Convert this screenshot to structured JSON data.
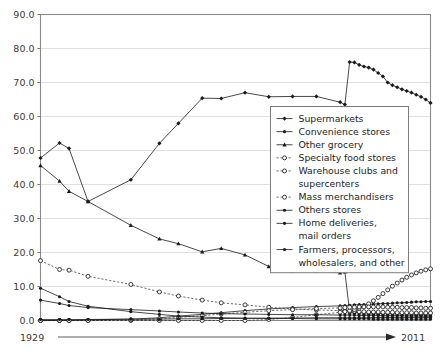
{
  "chart_data": {
    "type": "line",
    "title": "",
    "xlabel": "",
    "ylabel": "",
    "ylim": [
      0,
      90
    ],
    "yticks": [
      "0.0",
      "10.0",
      "20.0",
      "30.0",
      "40.0",
      "50.0",
      "60.0",
      "70.0",
      "80.0",
      "90.0"
    ],
    "ytick_values": [
      0,
      10,
      20,
      30,
      40,
      50,
      60,
      70,
      80,
      90
    ],
    "grid": true,
    "legend_position": "center-right",
    "x_axis": {
      "start_label": "1929",
      "end_label": "2011",
      "arrow": true,
      "x_start": 1929,
      "x_end": 2011
    },
    "x": [
      1929,
      1933,
      1935,
      1939,
      1948,
      1954,
      1958,
      1963,
      1967,
      1972,
      1977,
      1982,
      1987,
      1992,
      1993,
      1994,
      1995,
      1996,
      1997,
      1998,
      1999,
      2000,
      2001,
      2002,
      2003,
      2004,
      2005,
      2006,
      2007,
      2008,
      2009,
      2010,
      2011
    ],
    "series": [
      {
        "name": "Supermarkets",
        "marker": "filled-diamond",
        "linestyle": "solid",
        "values": [
          47.8,
          52.2,
          50.6,
          35.0,
          41.4,
          52.1,
          58.0,
          65.4,
          65.3,
          67.0,
          65.8,
          65.9,
          65.9,
          64.2,
          63.5,
          76.0,
          75.9,
          75.2,
          74.7,
          74.4,
          73.8,
          72.8,
          71.8,
          70.0,
          69.2,
          68.6,
          68.0,
          67.5,
          67.0,
          66.4,
          65.8,
          65.0,
          64.0
        ]
      },
      {
        "name": "Convenience stores",
        "marker": "filled-dot",
        "linestyle": "solid",
        "values": [
          0.0,
          0.0,
          0.0,
          0.2,
          0.4,
          0.8,
          1.3,
          1.8,
          2.3,
          2.9,
          3.4,
          3.8,
          4.1,
          4.3,
          4.4,
          4.5,
          4.6,
          4.7,
          4.7,
          4.8,
          4.8,
          4.9,
          5.0,
          5.0,
          5.1,
          5.2,
          5.2,
          5.3,
          5.4,
          5.5,
          5.5,
          5.6,
          5.6
        ]
      },
      {
        "name": "Other grocery",
        "marker": "filled-triangle",
        "linestyle": "solid",
        "values": [
          45.6,
          41.0,
          38.0,
          35.0,
          28.0,
          24.0,
          22.6,
          20.2,
          21.2,
          19.3,
          15.9,
          14.6,
          14.6,
          14.0,
          14.3,
          2.5,
          2.4,
          2.3,
          2.2,
          2.2,
          2.1,
          2.1,
          2.0,
          2.0,
          2.0,
          1.9,
          1.9,
          1.9,
          1.8,
          1.8,
          1.8,
          1.7,
          1.7
        ]
      },
      {
        "name": "Specialty food stores",
        "marker": "open-circle",
        "linestyle": "dotted",
        "values": [
          17.6,
          15.0,
          14.8,
          13.0,
          10.6,
          8.4,
          7.2,
          6.0,
          5.2,
          4.6,
          3.9,
          3.4,
          3.1,
          2.9,
          2.8,
          2.7,
          2.7,
          2.6,
          2.6,
          2.5,
          2.5,
          2.5,
          2.4,
          2.4,
          2.4,
          2.3,
          2.3,
          2.3,
          2.3,
          2.2,
          2.2,
          2.2,
          2.2
        ]
      },
      {
        "name": "Warehouse clubs and supercenters",
        "marker": "open-circle",
        "linestyle": "dotted",
        "values": [
          0.0,
          0.0,
          0.0,
          0.0,
          0.0,
          0.0,
          0.0,
          0.0,
          0.0,
          0.0,
          0.3,
          0.9,
          1.7,
          2.4,
          2.6,
          2.9,
          3.2,
          3.6,
          4.2,
          4.9,
          5.8,
          6.8,
          7.9,
          9.0,
          10.1,
          11.0,
          11.9,
          12.7,
          13.4,
          14.0,
          14.5,
          14.9,
          15.2
        ]
      },
      {
        "name": "Mass merchandisers",
        "marker": "open-circle",
        "linestyle": "dotted",
        "values": [
          0.0,
          0.0,
          0.0,
          0.0,
          0.2,
          0.5,
          0.9,
          1.4,
          1.9,
          2.4,
          2.9,
          3.2,
          3.5,
          3.7,
          3.8,
          3.9,
          3.9,
          4.0,
          4.0,
          4.0,
          4.0,
          4.0,
          4.0,
          3.9,
          3.9,
          3.9,
          3.8,
          3.8,
          3.8,
          3.7,
          3.7,
          3.6,
          3.6
        ]
      },
      {
        "name": "Others stores",
        "marker": "filled-dot",
        "linestyle": "solid",
        "values": [
          6.0,
          5.0,
          4.4,
          3.8,
          3.2,
          2.8,
          2.5,
          2.2,
          2.0,
          1.9,
          1.8,
          1.7,
          1.7,
          1.6,
          1.6,
          1.6,
          1.6,
          1.5,
          1.5,
          1.5,
          1.5,
          1.5,
          1.4,
          1.4,
          1.4,
          1.4,
          1.4,
          1.3,
          1.3,
          1.3,
          1.3,
          1.3,
          1.3
        ]
      },
      {
        "name": "Home deliveries, mail orders",
        "marker": "filled-dot",
        "linestyle": "solid",
        "values": [
          9.5,
          7.0,
          5.6,
          4.2,
          2.6,
          1.8,
          1.3,
          1.0,
          0.8,
          0.7,
          0.6,
          0.6,
          0.5,
          0.5,
          0.5,
          0.5,
          0.5,
          0.5,
          0.5,
          0.5,
          0.4,
          0.4,
          0.4,
          0.4,
          0.4,
          0.4,
          0.4,
          0.4,
          0.4,
          0.4,
          0.4,
          0.4,
          0.4
        ]
      },
      {
        "name": "Farmers, processors, wholesalers, and other",
        "marker": "filled-dot",
        "linestyle": "solid",
        "values": [
          0.3,
          0.3,
          0.3,
          0.3,
          0.4,
          0.4,
          0.5,
          0.5,
          0.6,
          0.6,
          0.7,
          0.7,
          0.8,
          0.8,
          0.8,
          0.8,
          0.8,
          0.8,
          0.8,
          0.8,
          0.9,
          0.9,
          0.9,
          0.9,
          0.9,
          0.9,
          0.9,
          0.9,
          0.9,
          0.9,
          0.9,
          0.9,
          0.9
        ]
      }
    ]
  },
  "colors": {
    "line": "#1a1a1a",
    "grid": "#d8d8d8",
    "frame": "#8a8a8a",
    "text": "#1d1d1d",
    "background": "#ffffff"
  }
}
